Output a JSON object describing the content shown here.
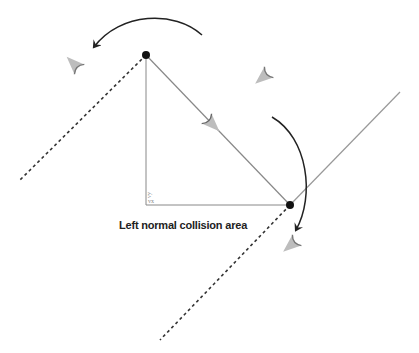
{
  "diagram": {
    "caption": "Left normal collision area",
    "component_labels": {
      "vx": "vx",
      "vy": "vy"
    },
    "colors": {
      "line": "#999999",
      "dashed": "#333333",
      "arrow": "#222222",
      "ship": "#b8b8b8",
      "ship_edge": "#666666",
      "point": "#111111"
    },
    "icons": [
      "ship-icon",
      "ship-icon",
      "ship-icon",
      "ship-icon",
      "curved-arrow-icon",
      "curved-arrow-icon"
    ]
  }
}
